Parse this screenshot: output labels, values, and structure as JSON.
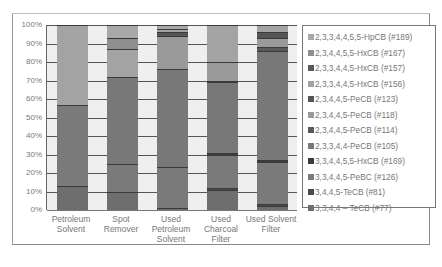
{
  "chart_data": {
    "type": "bar",
    "stacked": true,
    "percent": true,
    "title": "",
    "xlabel": "",
    "ylabel": "",
    "ylim": [
      0,
      100
    ],
    "yticks": [
      "0%",
      "10%",
      "20%",
      "30%",
      "40%",
      "50%",
      "60%",
      "70%",
      "80%",
      "90%",
      "100%"
    ],
    "categories": [
      "Petroleum Solvent",
      "Spot Remover",
      "Used Petroleum Solvent",
      "Used Charcoal Filter",
      "Used Solvent Filter"
    ],
    "category_lines": [
      [
        "Petroleum",
        "Solvent"
      ],
      [
        "Spot",
        "Remover"
      ],
      [
        "Used",
        "Petroleum",
        "Solvent"
      ],
      [
        "Used",
        "Charcoal",
        "Filter"
      ],
      [
        "Used Solvent",
        "Filter"
      ]
    ],
    "legend_position": "right",
    "grid": true,
    "series": [
      {
        "name": "3,3,4,4 – TeCB (#77)",
        "color": "#6e6e6e",
        "values": [
          13,
          10,
          1,
          11,
          2
        ]
      },
      {
        "name": "3,4,4,5-TeCB (#81)",
        "color": "#4a4a4a",
        "values": [
          0,
          0,
          0,
          1,
          1
        ]
      },
      {
        "name": "3,3,4,4,5-PeBC (#126)",
        "color": "#7a7a7a",
        "values": [
          44,
          15,
          22,
          18,
          23
        ]
      },
      {
        "name": "3,3,4,4,5,5-HxCB (#169)",
        "color": "#3c3c3c",
        "values": [
          0,
          0,
          0,
          1,
          1
        ]
      },
      {
        "name": "2,3,3,4,4-PeCB (#105)",
        "color": "#787878",
        "values": [
          0,
          47,
          53,
          38,
          59
        ]
      },
      {
        "name": "2,3,4,4,5-PeCB (#114)",
        "color": "#5a5a5a",
        "values": [
          0,
          0,
          0,
          1,
          2
        ]
      },
      {
        "name": "2,3,4,4,5-PeCB (#118)",
        "color": "#9a9a9a",
        "values": [
          0,
          0,
          18,
          10,
          5
        ]
      },
      {
        "name": "2,3,4,4,5-PeCB (#123)",
        "color": "#555555",
        "values": [
          0,
          0,
          2,
          0,
          3
        ]
      },
      {
        "name": "2,3,3,4,4,5-HxCB (#156)",
        "color": "#a3a3a3",
        "values": [
          43,
          15,
          2,
          20,
          4
        ]
      },
      {
        "name": "2,3,3,4,4,5-HxCB (#157)",
        "color": "#585858",
        "values": [
          0,
          0,
          0,
          0,
          0
        ]
      },
      {
        "name": "2,3,4,4,5,5-HxCB (#167)",
        "color": "#8e8e8e",
        "values": [
          0,
          6,
          0,
          0,
          0
        ]
      },
      {
        "name": "2,3,3,4,4,5,5-HpCB (#189)",
        "color": "#a8a8a8",
        "values": [
          0,
          7,
          2,
          0,
          0
        ]
      }
    ],
    "legend_order": [
      "2,3,3,4,4,5,5-HpCB (#189)",
      "2,3,4,4,5,5-HxCB (#167)",
      "2,3,3,4,4,5-HxCB (#157)",
      "2,3,3,4,4,5-HxCB (#156)",
      "2,3,4,4,5-PeCB (#123)",
      "2,3,4,4,5-PeCB (#118)",
      "2,3,4,4,5-PeCB (#114)",
      "2,3,3,4,4-PeCB (#105)",
      "3,3,4,4,5,5-HxCB (#169)",
      "3,3,4,4,5-PeBC (#126)",
      "3,4,4,5-TeCB (#81)",
      "3,3,4,4 – TeCB (#77)"
    ]
  }
}
